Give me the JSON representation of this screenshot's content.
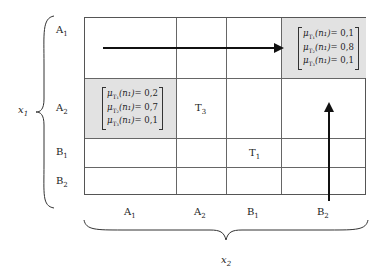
{
  "axes": {
    "x1_label": "x",
    "x1_sub": "1",
    "x2_label": "x",
    "x2_sub": "2"
  },
  "rows": [
    {
      "label": "A",
      "sub": "1"
    },
    {
      "label": "A",
      "sub": "2"
    },
    {
      "label": "B",
      "sub": "1"
    },
    {
      "label": "B",
      "sub": "2"
    }
  ],
  "cols": [
    {
      "label": "A",
      "sub": "1"
    },
    {
      "label": "A",
      "sub": "2"
    },
    {
      "label": "B",
      "sub": "1"
    },
    {
      "label": "B",
      "sub": "2"
    }
  ],
  "cells": {
    "t3": {
      "label": "T",
      "sub": "3"
    },
    "t1": {
      "label": "T",
      "sub": "1"
    }
  },
  "matrix_top_right": {
    "lines": [
      {
        "mu": "μ",
        "sub": "T₁",
        "arg": "(n₁)",
        "value": "= 0,1"
      },
      {
        "mu": "μ",
        "sub": "T₂",
        "arg": "(n₁)",
        "value": "= 0,8"
      },
      {
        "mu": "μ",
        "sub": "T₃",
        "arg": "(n₁)",
        "value": "= 0,1"
      }
    ]
  },
  "matrix_left": {
    "lines": [
      {
        "mu": "μ",
        "sub": "T₁",
        "arg": "(n₁)",
        "value": "= 0,2"
      },
      {
        "mu": "μ",
        "sub": "T₂",
        "arg": "(n₁)",
        "value": "= 0,7"
      },
      {
        "mu": "μ",
        "sub": "T₃",
        "arg": "(n₁)",
        "value": "= 0,1"
      }
    ]
  },
  "colors": {
    "shade": "#e2e2e2",
    "grid": "#666666",
    "arrow": "#111111"
  }
}
